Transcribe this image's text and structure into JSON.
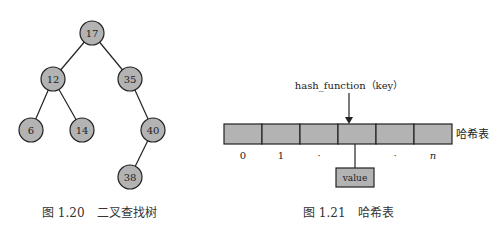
{
  "figure_left": {
    "caption": "图 1.20　二叉查找树",
    "nodes": [
      {
        "id": "n17",
        "label": "17",
        "x": 92,
        "y": 33
      },
      {
        "id": "n12",
        "label": "12",
        "x": 53,
        "y": 79
      },
      {
        "id": "n35",
        "label": "35",
        "x": 130,
        "y": 79
      },
      {
        "id": "n6",
        "label": "6",
        "x": 31,
        "y": 130
      },
      {
        "id": "n14",
        "label": "14",
        "x": 82,
        "y": 130
      },
      {
        "id": "n40",
        "label": "40",
        "x": 153,
        "y": 130
      },
      {
        "id": "n38",
        "label": "38",
        "x": 130,
        "y": 177
      }
    ],
    "edges": [
      [
        "17",
        "12"
      ],
      [
        "17",
        "35"
      ],
      [
        "12",
        "6"
      ],
      [
        "12",
        "14"
      ],
      [
        "35",
        "40"
      ],
      [
        "40",
        "38"
      ]
    ],
    "node_fill": "#b3b3b3",
    "node_stroke": "#222222"
  },
  "figure_right": {
    "caption": "图 1.21　哈希表",
    "function_label": "hash_function（key）",
    "table_label": "哈希表",
    "index_labels": [
      "0",
      "1",
      "·",
      "",
      "·",
      "n"
    ],
    "value_label": "value",
    "cell_fill": "#b3b3b3",
    "cell_stroke": "#222222"
  }
}
